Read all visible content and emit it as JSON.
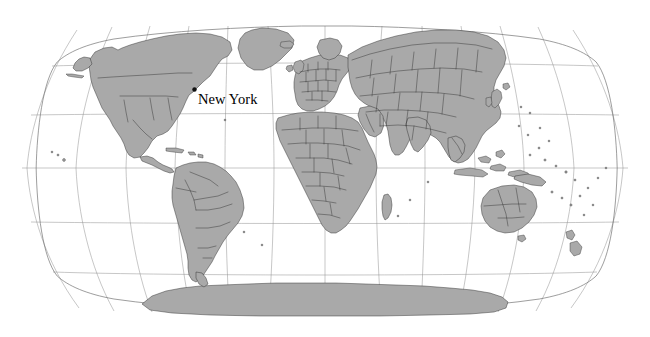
{
  "map": {
    "title": "World Map",
    "projection": "Robinson",
    "background_color": "#ffffff",
    "land_fill_color": "#a9a9a9",
    "land_border_color": "#2b2b2b",
    "country_border_color": "#303030",
    "graticule_color": "#8e8e8e",
    "outline_color": "#6d6d6d",
    "extent": {
      "width": 650,
      "height": 337
    },
    "frame": {
      "left": 22,
      "right": 628,
      "top": 26,
      "bottom": 312
    },
    "graticule_info": {
      "parallel_interval_degrees": 30,
      "meridian_interval_degrees": 30,
      "parallels_latitudes": [
        60,
        30,
        0,
        -30,
        -60
      ],
      "meridians_longitudes": [
        -150,
        -120,
        -90,
        -60,
        -30,
        0,
        30,
        60,
        90,
        120,
        150
      ],
      "equator_y": 168
    },
    "labels": [
      {
        "id": "new-york",
        "text": "New York",
        "x": 198,
        "y": 92,
        "marker_x": 194.5,
        "marker_y": 89.5,
        "font_size_px": 14.5
      }
    ],
    "continents": [
      "North America",
      "South America",
      "Europe",
      "Africa",
      "Asia",
      "Australia",
      "Antarctica"
    ]
  }
}
